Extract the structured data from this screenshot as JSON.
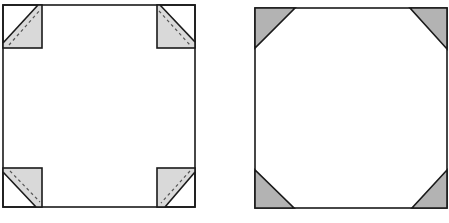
{
  "diagram": {
    "figures": [
      {
        "name": "left-square",
        "description": "Square with four folded corner flaps (dashed fold lines)",
        "square": {
          "x": 3,
          "y": 5,
          "size": 192
        },
        "corner_box": 39,
        "fill": "#d9d9d9",
        "stroke": "#1a1a1a"
      },
      {
        "name": "right-square",
        "description": "Square with four shaded corner triangles",
        "square": {
          "x": 255,
          "y": 8,
          "size": 192
        },
        "triangle_leg": 40,
        "fill": "#b3b3b3",
        "stroke": "#1a1a1a"
      }
    ]
  }
}
